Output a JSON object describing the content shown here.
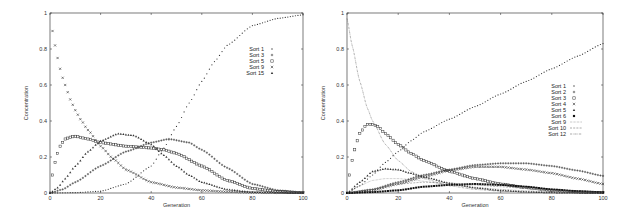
{
  "chart_data": [
    {
      "type": "scatter",
      "title": "",
      "xlabel": "Generation",
      "ylabel": "Concentration",
      "xlim": [
        0,
        100
      ],
      "ylim": [
        0,
        1
      ],
      "xticks": [
        "0",
        "20",
        "40",
        "60",
        "80",
        "100"
      ],
      "yticks": [
        "0",
        "0.2",
        "0.4",
        "0.6",
        "0.8",
        "1"
      ],
      "grid": false,
      "legend_position": "upper right",
      "frame": {
        "x0": 50,
        "x1": 303,
        "y0": 193,
        "y1": 13
      },
      "series": [
        {
          "name": "Sort 1",
          "marker": "dot",
          "x": [
            0,
            10,
            20,
            30,
            40,
            45,
            50,
            55,
            60,
            65,
            70,
            80,
            90,
            100
          ],
          "y": [
            0,
            0.002,
            0.01,
            0.05,
            0.15,
            0.25,
            0.37,
            0.5,
            0.62,
            0.73,
            0.82,
            0.93,
            0.97,
            0.99
          ]
        },
        {
          "name": "Sort 3",
          "marker": "plus",
          "x": [
            0,
            5,
            10,
            20,
            30,
            40,
            47,
            55,
            60,
            70,
            80,
            90,
            100
          ],
          "y": [
            0,
            0.02,
            0.06,
            0.15,
            0.23,
            0.28,
            0.3,
            0.28,
            0.24,
            0.14,
            0.05,
            0.015,
            0.003
          ]
        },
        {
          "name": "Sort 5",
          "marker": "square",
          "x": [
            1,
            2,
            3,
            4,
            5,
            6,
            8,
            10,
            15,
            20,
            30,
            40,
            45,
            50,
            60,
            70,
            80,
            90,
            100
          ],
          "y": [
            0.1,
            0.17,
            0.22,
            0.26,
            0.28,
            0.3,
            0.31,
            0.315,
            0.3,
            0.28,
            0.26,
            0.25,
            0.24,
            0.22,
            0.15,
            0.07,
            0.025,
            0.008,
            0.002
          ]
        },
        {
          "name": "Sort 9",
          "marker": "cross",
          "x": [
            1,
            2,
            3,
            4,
            5,
            6,
            7,
            8,
            10,
            12,
            15,
            20,
            25,
            30,
            40,
            50,
            60,
            70,
            80,
            100
          ],
          "y": [
            0.9,
            0.82,
            0.75,
            0.69,
            0.64,
            0.6,
            0.56,
            0.52,
            0.46,
            0.41,
            0.35,
            0.26,
            0.19,
            0.13,
            0.06,
            0.03,
            0.015,
            0.007,
            0.003,
            0.001
          ]
        },
        {
          "name": "Sort 15",
          "marker": "triangle",
          "x": [
            0,
            3,
            6,
            10,
            15,
            20,
            27,
            33,
            40,
            45,
            50,
            55,
            60,
            70,
            80,
            100
          ],
          "y": [
            0,
            0.03,
            0.08,
            0.15,
            0.23,
            0.29,
            0.33,
            0.32,
            0.27,
            0.21,
            0.15,
            0.1,
            0.06,
            0.02,
            0.005,
            0
          ]
        }
      ],
      "legend": [
        {
          "label": "Sort 1",
          "marker": "dot"
        },
        {
          "label": "Sort 3",
          "marker": "plus"
        },
        {
          "label": "Sort 5",
          "marker": "square"
        },
        {
          "label": "Sort 9",
          "marker": "cross"
        },
        {
          "label": "Sort 15",
          "marker": "triangle"
        }
      ]
    },
    {
      "type": "scatter",
      "title": "",
      "xlabel": "Generation",
      "ylabel": "Concentration",
      "xlim": [
        0,
        100
      ],
      "ylim": [
        0,
        1
      ],
      "xticks": [
        "0",
        "20",
        "40",
        "60",
        "80",
        "100"
      ],
      "yticks": [
        "0",
        "0.2",
        "0.4",
        "0.6",
        "0.8",
        "1"
      ],
      "grid": false,
      "legend_position": "right",
      "frame": {
        "x0": 347,
        "x1": 603,
        "y0": 193,
        "y1": 13
      },
      "series": [
        {
          "name": "Sort 1",
          "marker": "dot",
          "x": [
            0,
            5,
            10,
            15,
            20,
            25,
            30,
            40,
            50,
            60,
            70,
            80,
            90,
            100
          ],
          "y": [
            0,
            0.04,
            0.1,
            0.17,
            0.23,
            0.29,
            0.34,
            0.41,
            0.48,
            0.55,
            0.62,
            0.69,
            0.76,
            0.83
          ]
        },
        {
          "name": "Sort 2",
          "marker": "plus",
          "x": [
            0,
            10,
            20,
            30,
            40,
            50,
            60,
            70,
            80,
            90,
            100
          ],
          "y": [
            0,
            0.02,
            0.06,
            0.1,
            0.13,
            0.155,
            0.165,
            0.165,
            0.15,
            0.125,
            0.095
          ]
        },
        {
          "name": "Sort 3",
          "marker": "square",
          "x": [
            1,
            2,
            3,
            4,
            5,
            6,
            7,
            8,
            10,
            12,
            15,
            20,
            25,
            30,
            40,
            50,
            60,
            70,
            80,
            90,
            100
          ],
          "y": [
            0.1,
            0.18,
            0.24,
            0.29,
            0.33,
            0.35,
            0.37,
            0.38,
            0.38,
            0.37,
            0.33,
            0.27,
            0.22,
            0.18,
            0.12,
            0.08,
            0.05,
            0.03,
            0.015,
            0.006,
            0.002
          ]
        },
        {
          "name": "Sort 4",
          "marker": "cross",
          "x": [
            0,
            10,
            20,
            30,
            40,
            50,
            60,
            70,
            80,
            90,
            100
          ],
          "y": [
            0,
            0.015,
            0.05,
            0.09,
            0.125,
            0.145,
            0.145,
            0.13,
            0.11,
            0.08,
            0.05
          ]
        },
        {
          "name": "Sort 5",
          "marker": "triangle",
          "x": [
            0,
            5,
            10,
            15,
            20,
            25,
            30,
            40,
            50,
            60,
            70,
            80,
            100
          ],
          "y": [
            0,
            0.06,
            0.12,
            0.135,
            0.13,
            0.11,
            0.09,
            0.055,
            0.03,
            0.015,
            0.007,
            0.003,
            0
          ]
        },
        {
          "name": "Sort 6",
          "marker": "filled-square",
          "x": [
            0,
            10,
            20,
            30,
            40,
            50,
            60,
            70,
            80,
            90,
            100
          ],
          "y": [
            0,
            0.005,
            0.015,
            0.035,
            0.045,
            0.05,
            0.045,
            0.035,
            0.02,
            0.01,
            0.004
          ]
        },
        {
          "name": "Sort 9",
          "marker": "dotted-line",
          "x": [
            0,
            5,
            10,
            15,
            20,
            25,
            30,
            40,
            50,
            60,
            70,
            80,
            90,
            100
          ],
          "y": [
            0,
            0.04,
            0.07,
            0.08,
            0.08,
            0.075,
            0.065,
            0.045,
            0.03,
            0.02,
            0.012,
            0.007,
            0.004,
            0.002
          ]
        },
        {
          "name": "Sort 10",
          "marker": "dashed-line",
          "x": [
            0,
            10,
            20,
            30,
            40,
            50,
            60,
            70,
            80,
            90,
            100
          ],
          "y": [
            0,
            0.02,
            0.05,
            0.06,
            0.055,
            0.045,
            0.035,
            0.025,
            0.015,
            0.01,
            0.005
          ]
        },
        {
          "name": "Sort 12",
          "marker": "dash-dot-line",
          "x": [
            0,
            2,
            5,
            8,
            10,
            15,
            20,
            25,
            30,
            40,
            50,
            60,
            80,
            100
          ],
          "y": [
            0.97,
            0.82,
            0.62,
            0.47,
            0.4,
            0.27,
            0.18,
            0.12,
            0.08,
            0.04,
            0.02,
            0.01,
            0.003,
            0.001
          ]
        }
      ],
      "legend": [
        {
          "label": "Sort 1",
          "marker": "dot"
        },
        {
          "label": "Sort 2",
          "marker": "plus"
        },
        {
          "label": "Sort 3",
          "marker": "square"
        },
        {
          "label": "Sort 4",
          "marker": "cross"
        },
        {
          "label": "Sort 5",
          "marker": "triangle"
        },
        {
          "label": "Sort 6",
          "marker": "filled-square"
        },
        {
          "label": "Sort 9",
          "marker": "dotted-line"
        },
        {
          "label": "Sort 10",
          "marker": "dashed-line"
        },
        {
          "label": "Sort 12",
          "marker": "dash-dot-line"
        }
      ]
    }
  ]
}
